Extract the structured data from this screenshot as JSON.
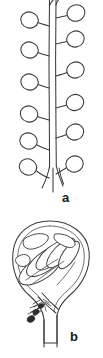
{
  "figure": {
    "domain": "botanical-line-drawing",
    "background_color": "#ffffff",
    "ink_color": "#3b3b3b",
    "label_color": "#1a1a1a",
    "width_px": 103,
    "height_px": 358,
    "panels": [
      {
        "id": "a",
        "label": "a",
        "caption_label": "a",
        "subject": "inflorescence-raceme-with-pedicellate-buds",
        "description": "Elongate axis bearing alternating stalked rounded buds along both sides",
        "bud_count": 14,
        "axis_orientation": "vertical",
        "base_form": "forked-stem"
      },
      {
        "id": "b",
        "label": "b",
        "caption_label": "b",
        "subject": "flower-bud-longitudinal-section",
        "description": "Rounded bud shown in section with overlapping inner organs and a thick stalk below",
        "inner_organ_count": 7,
        "stalk_form": "thick-pedicel"
      }
    ]
  }
}
